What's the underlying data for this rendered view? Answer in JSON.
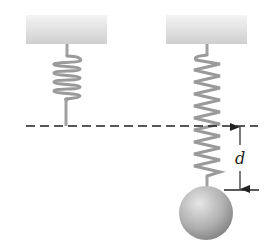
{
  "figure": {
    "labels": {
      "displacement": "d"
    },
    "colors": {
      "ceiling_top": "#d9d9d9",
      "ceiling_bottom": "#f2f2f2",
      "spring": "#9a9a9a",
      "ball_light": "#d8d8d8",
      "ball_dark": "#8a8a8a",
      "line": "#222222"
    }
  }
}
